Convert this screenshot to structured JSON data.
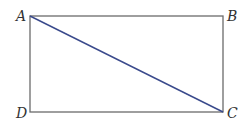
{
  "diagram": {
    "type": "rectangle-with-diagonal",
    "colors": {
      "background": "#ffffff",
      "rectangle_stroke": "#6b6b6b",
      "diagonal_stroke": "#3a4a8c",
      "label": "#333333"
    },
    "vertices": [
      {
        "name": "A",
        "x": 30,
        "y": 16
      },
      {
        "name": "B",
        "x": 223,
        "y": 16
      },
      {
        "name": "C",
        "x": 223,
        "y": 112
      },
      {
        "name": "D",
        "x": 30,
        "y": 112
      }
    ],
    "segments": [
      {
        "from": "A",
        "to": "B",
        "kind": "side"
      },
      {
        "from": "B",
        "to": "C",
        "kind": "side"
      },
      {
        "from": "C",
        "to": "D",
        "kind": "side"
      },
      {
        "from": "D",
        "to": "A",
        "kind": "side"
      },
      {
        "from": "A",
        "to": "C",
        "kind": "diagonal"
      }
    ],
    "labels": {
      "a": "A",
      "b": "B",
      "c": "C",
      "d": "D"
    }
  }
}
